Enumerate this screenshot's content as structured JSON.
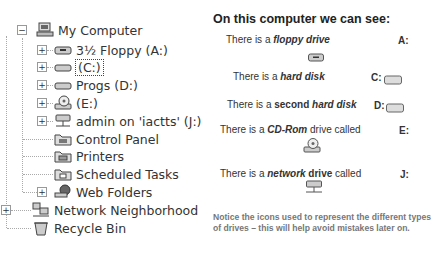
{
  "tree": {
    "items": [
      {
        "label": "My Computer",
        "icon": "computer-icon",
        "expander": "−"
      },
      {
        "label": "3½ Floppy (A:)",
        "icon": "floppy-drive-icon",
        "expander": "+"
      },
      {
        "label": "(C:)",
        "icon": "hard-disk-icon",
        "expander": "+",
        "selected": true
      },
      {
        "label": "Progs (D:)",
        "icon": "hard-disk-icon",
        "expander": "+"
      },
      {
        "label": "(E:)",
        "icon": "cdrom-drive-icon",
        "expander": "+"
      },
      {
        "label": "admin on 'iactts' (J:)",
        "icon": "network-drive-icon",
        "expander": "+"
      },
      {
        "label": "Control Panel",
        "icon": "control-panel-icon"
      },
      {
        "label": "Printers",
        "icon": "printers-icon"
      },
      {
        "label": "Scheduled Tasks",
        "icon": "scheduled-tasks-icon"
      },
      {
        "label": "Web Folders",
        "icon": "web-folders-icon",
        "expander": "+"
      },
      {
        "label": "Network Neighborhood",
        "icon": "network-neighborhood-icon",
        "expander": "+"
      },
      {
        "label": "Recycle Bin",
        "icon": "recycle-bin-icon"
      }
    ]
  },
  "panel": {
    "title": "On this computer we can see:",
    "lines": [
      {
        "prefix": "There is a ",
        "bold": "floppy drive",
        "suffix": "",
        "drive": "A:",
        "icon": "floppy-drive-icon"
      },
      {
        "prefix": "There is a ",
        "bold": "hard disk",
        "suffix": "",
        "drive": "C:",
        "icon": "hard-disk-icon"
      },
      {
        "prefix": "There is a ",
        "bold_plain": "second ",
        "bold": "hard disk",
        "suffix": "",
        "drive": "D:",
        "icon": "hard-disk-icon"
      },
      {
        "prefix": "There is a ",
        "bold": "CD-Rom",
        "suffix": " drive called",
        "drive": "E:",
        "icon": "cdrom-drive-icon"
      },
      {
        "prefix": "There is a ",
        "bold": "network",
        "bold_plain": " drive",
        "suffix": " called",
        "drive": "J:",
        "icon": "network-drive-icon"
      }
    ],
    "note": "Notice the icons used to represent the different types of drives – this will help avoid mistakes later on."
  }
}
